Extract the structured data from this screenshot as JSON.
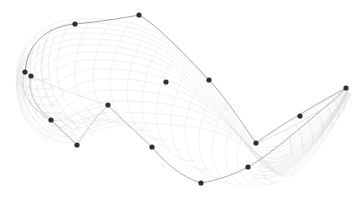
{
  "viewport": {
    "width": 361,
    "height": 197,
    "background_color": "#ffffff",
    "title": "Surface Wireframe Viewport"
  },
  "surface": {
    "name": "nurbs-surface-mesh",
    "render_mode": "wireframe",
    "iso_line_color": "#dcdcdc",
    "iso_line_color_dense": "#d2d2d2",
    "silhouette_color": "#6a6a72",
    "silhouette_color_soft": "#9a9aa2",
    "iso_line_width": 0.4,
    "silhouette_width": 0.55,
    "u_divisions": 26,
    "v_divisions": 16
  },
  "control_points": {
    "name": "control-point-set",
    "color": "#2e2e38",
    "radius": 2.6,
    "count": 18,
    "points": [
      {
        "id": "cp-01",
        "x": 75,
        "y": 24
      },
      {
        "id": "cp-02",
        "x": 139,
        "y": 15
      },
      {
        "id": "cp-03",
        "x": 25,
        "y": 72
      },
      {
        "id": "cp-04",
        "x": 31,
        "y": 76
      },
      {
        "id": "cp-05",
        "x": 166,
        "y": 82
      },
      {
        "id": "cp-06",
        "x": 209,
        "y": 80
      },
      {
        "id": "cp-07",
        "x": 108,
        "y": 105
      },
      {
        "id": "cp-08",
        "x": 51,
        "y": 120
      },
      {
        "id": "cp-09",
        "x": 77,
        "y": 145
      },
      {
        "id": "cp-10",
        "x": 152,
        "y": 147
      },
      {
        "id": "cp-11",
        "x": 201,
        "y": 183
      },
      {
        "id": "cp-12",
        "x": 256,
        "y": 143
      },
      {
        "id": "cp-13",
        "x": 248,
        "y": 167
      },
      {
        "id": "cp-14",
        "x": 300,
        "y": 116
      },
      {
        "id": "cp-15",
        "x": 346,
        "y": 88
      }
    ]
  },
  "chart_data": {
    "type": "scatter",
    "title": "",
    "xlabel": "",
    "ylabel": "",
    "xlim": [
      0,
      361
    ],
    "ylim": [
      0,
      197
    ],
    "grid": false,
    "legend": null,
    "series": [
      {
        "name": "control points",
        "marker": "filled-circle",
        "color": "#2e2e38",
        "x": [
          75,
          139,
          25,
          31,
          166,
          209,
          108,
          51,
          77,
          152,
          201,
          256,
          248,
          300,
          346
        ],
        "y": [
          24,
          15,
          72,
          76,
          82,
          80,
          105,
          120,
          145,
          147,
          183,
          143,
          167,
          116,
          88
        ]
      },
      {
        "name": "silhouette boundary",
        "type": "line",
        "color": "#6a6a72",
        "x": [
          25,
          75,
          139,
          209,
          256,
          300,
          346,
          248,
          201,
          152,
          108,
          77,
          51,
          25
        ],
        "y": [
          72,
          24,
          15,
          80,
          143,
          116,
          88,
          167,
          183,
          147,
          105,
          145,
          120,
          72
        ]
      }
    ]
  }
}
